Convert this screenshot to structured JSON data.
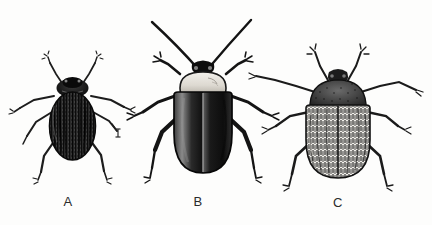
{
  "plate": {
    "kind": "scientific-illustration-plate",
    "medium": "ink engraving / stipple drawing",
    "subject": "three beetles, dorsal view",
    "background_color": "#fdfdfc",
    "ink_color": "#1a1a1a",
    "width": 432,
    "height": 225
  },
  "figures": [
    {
      "id": "A",
      "label": "A",
      "label_x": 68,
      "label_y": 202,
      "description": "smallest beetle, dark oval body with fine longitudinal striations on elytra, dark head and pronotum, antennae raised in a V",
      "body_color": "#262626",
      "pronotum_color": "#1c1c1c",
      "center_x": 72,
      "center_y": 120,
      "body_width": 46,
      "body_height": 78,
      "relative_size": "small"
    },
    {
      "id": "B",
      "label": "B",
      "label_x": 198,
      "label_y": 202,
      "description": "largest beetle, pale light-colored pronotum contrasting with very dark glossy elytra, long slender antennae splayed widely upward",
      "body_color": "#141414",
      "pronotum_color": "#e8e6e0",
      "center_x": 203,
      "center_y": 128,
      "body_width": 62,
      "body_height": 90,
      "relative_size": "large"
    },
    {
      "id": "C",
      "label": "C",
      "label_x": 338,
      "label_y": 203,
      "description": "broad beetle densely covered in hair-like setae giving a streaked vertical texture, antennae angled down and outward",
      "body_color": "#3a3a3a",
      "pronotum_color": "#333333",
      "center_x": 338,
      "center_y": 128,
      "body_width": 66,
      "body_height": 92,
      "relative_size": "medium-large"
    }
  ],
  "marks": [
    {
      "name": "scale-tick",
      "glyph": "I",
      "x": 118,
      "y": 133,
      "near_figure": "A"
    }
  ]
}
